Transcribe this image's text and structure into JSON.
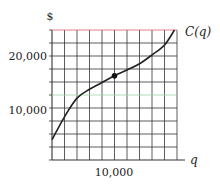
{
  "chart_data": {
    "type": "line",
    "title": "",
    "xlabel": "q",
    "ylabel": "$",
    "series_label": "C(q)",
    "xlim": [
      0,
      20000
    ],
    "ylim": [
      0,
      25000
    ],
    "grid": true,
    "grid_columns": 10,
    "grid_rows": 10,
    "x_ticks": [
      {
        "value": 10000,
        "label": "10,000"
      }
    ],
    "y_ticks": [
      {
        "value": 10000,
        "label": "10,000"
      },
      {
        "value": 20000,
        "label": "20,000"
      }
    ],
    "series": [
      {
        "name": "C(q)",
        "x": [
          0,
          2000,
          4000,
          6000,
          8000,
          10000,
          12000,
          14000,
          16000,
          18000,
          19600
        ],
        "values": [
          3900,
          8300,
          11900,
          13600,
          14900,
          16200,
          17300,
          18500,
          20200,
          22100,
          25000
        ]
      }
    ],
    "annotations": [
      {
        "type": "point",
        "x": 10000,
        "y": 16200,
        "label": "inflection point"
      }
    ],
    "colors": {
      "grid": "#333333",
      "top_gridline": "#d9606a",
      "highlight_gridline": "#9ed3a8",
      "curve": "#222222"
    }
  },
  "labels": {
    "y_axis": "$",
    "x_axis": "q",
    "curve": "C(q)",
    "y_tick_20000": "20,000",
    "y_tick_10000": "10,000",
    "x_tick_10000": "10,000"
  }
}
